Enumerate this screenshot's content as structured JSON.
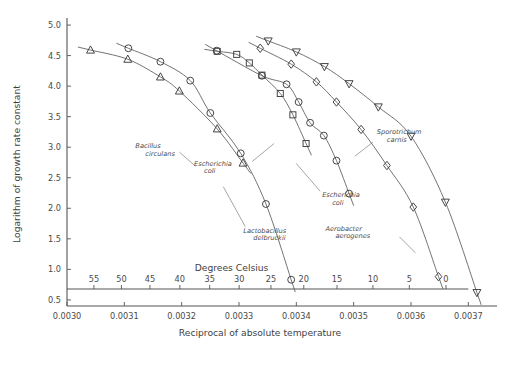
{
  "chart_data": {
    "type": "scatter",
    "title": "",
    "xlabel": "Reciprocal of absolute temperature",
    "ylabel": "Logarithm of growth rate constant",
    "secondary_xlabel": "Degrees Celsius",
    "xlim": [
      0.003,
      0.00375
    ],
    "ylim": [
      0.4,
      5.05
    ],
    "grid": false,
    "legend": "inline-annotations",
    "xticks": [
      "0.0030",
      "0.0031",
      "0.0032",
      "0.0033",
      "0.0034",
      "0.0035",
      "0.0036",
      "0.0037"
    ],
    "xtick_values": [
      0.003,
      0.0031,
      0.0032,
      0.0033,
      0.0034,
      0.0035,
      0.0036,
      0.0037
    ],
    "yticks": [
      "5.0",
      "4.5",
      "4.0",
      "3.5",
      "3.0",
      "2.5",
      "2.0",
      "1.5",
      "1.0",
      "0.5"
    ],
    "ytick_values": [
      5.0,
      4.5,
      4.0,
      3.5,
      3.0,
      2.5,
      2.0,
      1.5,
      1.0,
      0.5
    ],
    "celsius_ticks": [
      "55",
      "50",
      "45",
      "40",
      "35",
      "30",
      "25",
      "20",
      "15",
      "10",
      "5",
      "0"
    ],
    "celsius_values": [
      55,
      50,
      45,
      40,
      35,
      30,
      25,
      20,
      15,
      10,
      5,
      0
    ],
    "celsius_positions": [
      0.003047,
      0.0030949,
      0.0031447,
      0.0031968,
      0.0032489,
      0.0033003,
      0.0033557,
      0.003413,
      0.003471,
      0.0035336,
      0.0035971,
      0.003661
    ],
    "series": [
      {
        "name": "Bacillus circulans",
        "marker": "triangle-up",
        "label_x": 0.003196,
        "label_y": 2.92,
        "points": [
          {
            "x": 0.003041,
            "y": 4.59
          },
          {
            "x": 0.003106,
            "y": 4.44
          },
          {
            "x": 0.003163,
            "y": 4.15
          },
          {
            "x": 0.003196,
            "y": 3.92
          },
          {
            "x": 0.003262,
            "y": 3.3
          },
          {
            "x": 0.003307,
            "y": 2.74
          }
        ]
      },
      {
        "name": "Lactobacillus delbruckii",
        "marker": "circle",
        "label_x": 0.003318,
        "label_y": 1.6,
        "points": [
          {
            "x": 0.003107,
            "y": 4.62
          },
          {
            "x": 0.003163,
            "y": 4.4
          },
          {
            "x": 0.003215,
            "y": 4.09
          },
          {
            "x": 0.00325,
            "y": 3.56
          },
          {
            "x": 0.003303,
            "y": 2.9
          },
          {
            "x": 0.003347,
            "y": 2.07
          },
          {
            "x": 0.003391,
            "y": 0.83
          }
        ]
      },
      {
        "name": "Escherichia coli",
        "marker": "square",
        "label_x": 0.003274,
        "label_y": 2.7,
        "points": [
          {
            "x": 0.003262,
            "y": 4.57
          },
          {
            "x": 0.003296,
            "y": 4.52
          },
          {
            "x": 0.003318,
            "y": 4.38
          },
          {
            "x": 0.00334,
            "y": 4.18
          },
          {
            "x": 0.003372,
            "y": 3.88
          },
          {
            "x": 0.003394,
            "y": 3.53
          },
          {
            "x": 0.003417,
            "y": 3.06
          }
        ]
      },
      {
        "name": "Escherichia coli",
        "marker": "circle",
        "label_x": 0.003452,
        "label_y": 2.18,
        "points": [
          {
            "x": 0.003261,
            "y": 4.58
          },
          {
            "x": 0.00334,
            "y": 4.17
          },
          {
            "x": 0.003383,
            "y": 4.03
          },
          {
            "x": 0.003404,
            "y": 3.74
          },
          {
            "x": 0.003424,
            "y": 3.4
          },
          {
            "x": 0.003448,
            "y": 3.19
          },
          {
            "x": 0.00347,
            "y": 2.78
          },
          {
            "x": 0.003492,
            "y": 2.24
          }
        ]
      },
      {
        "name": "Aerobacter aerogenes",
        "marker": "diamond",
        "label_x": 0.003538,
        "label_y": 1.63,
        "points": [
          {
            "x": 0.003337,
            "y": 4.62
          },
          {
            "x": 0.003391,
            "y": 4.36
          },
          {
            "x": 0.003435,
            "y": 4.07
          },
          {
            "x": 0.00347,
            "y": 3.74
          },
          {
            "x": 0.003513,
            "y": 3.29
          },
          {
            "x": 0.003558,
            "y": 2.7
          },
          {
            "x": 0.003604,
            "y": 2.02
          },
          {
            "x": 0.003648,
            "y": 0.88
          }
        ]
      },
      {
        "name": "Sporotrichum carnis",
        "marker": "triangle-down",
        "label_x": 0.00353,
        "label_y": 3.18,
        "points": [
          {
            "x": 0.003351,
            "y": 4.74
          },
          {
            "x": 0.0034,
            "y": 4.56
          },
          {
            "x": 0.003449,
            "y": 4.32
          },
          {
            "x": 0.003492,
            "y": 4.04
          },
          {
            "x": 0.003543,
            "y": 3.66
          },
          {
            "x": 0.0036,
            "y": 3.18
          },
          {
            "x": 0.00366,
            "y": 2.1
          },
          {
            "x": 0.003715,
            "y": 0.62
          }
        ]
      }
    ]
  }
}
